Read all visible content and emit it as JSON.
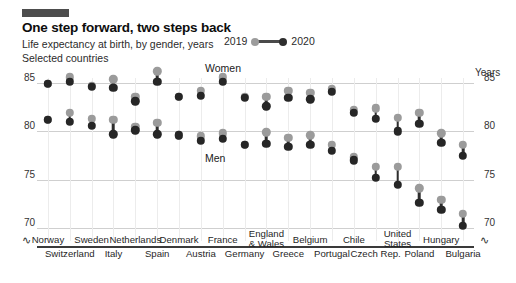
{
  "header": {
    "title": "One step forward, two steps back",
    "subtitle": "Life expectancy at birth, by gender, years",
    "subtitle2": "Selected countries",
    "accent_color": "#4d4d4d"
  },
  "legend": {
    "label_2019": "2019",
    "label_2020": "2020",
    "color_2019": "#9b9b9b",
    "color_2020": "#262626"
  },
  "axis": {
    "units_label": "Years",
    "yticks": [
      "85",
      "80",
      "75",
      "70"
    ],
    "squiggle": "∿"
  },
  "annotations": {
    "women": "Women",
    "men": "Men"
  },
  "chart_data": {
    "type": "scatter",
    "title": "One step forward, two steps back",
    "subtitle": "Life expectancy at birth, by gender, years — Selected countries",
    "xlabel": "",
    "ylabel": "Years",
    "ylim": [
      69,
      86.5
    ],
    "yticks": [
      70,
      75,
      80,
      85
    ],
    "grid": true,
    "legend_position": "top-right",
    "series_names": [
      "2019",
      "2020"
    ],
    "groups": [
      "Women",
      "Men"
    ],
    "categories": [
      "Norway",
      "Switzerland",
      "Sweden",
      "Italy",
      "Netherlands",
      "Spain",
      "Denmark",
      "Austria",
      "France",
      "Germany",
      "England & Wales",
      "Greece",
      "Belgium",
      "Portugal",
      "Chile",
      "Czech Rep.",
      "United States",
      "Poland",
      "Hungary",
      "Bulgaria"
    ],
    "category_rows": [
      "top",
      "bottom",
      "top",
      "bottom",
      "top",
      "bottom",
      "top",
      "bottom",
      "top",
      "bottom",
      "top",
      "bottom",
      "top",
      "bottom",
      "top",
      "bottom",
      "top",
      "bottom",
      "top",
      "bottom"
    ],
    "women": {
      "2019": [
        84.9,
        85.6,
        84.7,
        85.4,
        83.6,
        86.2,
        83.6,
        84.2,
        85.6,
        83.6,
        83.6,
        84.2,
        84.0,
        84.4,
        82.2,
        82.4,
        81.4,
        81.9,
        79.8,
        78.6
      ],
      "2020": [
        84.9,
        85.1,
        84.6,
        84.5,
        83.1,
        85.1,
        83.6,
        83.7,
        85.1,
        83.5,
        82.6,
        83.5,
        83.3,
        84.1,
        81.9,
        81.3,
        80.0,
        80.8,
        78.8,
        77.5
      ]
    },
    "men": {
      "2019": [
        81.2,
        81.9,
        81.3,
        81.2,
        80.5,
        80.9,
        79.6,
        79.5,
        79.8,
        78.6,
        79.9,
        79.3,
        79.6,
        78.6,
        77.3,
        76.3,
        76.3,
        74.1,
        72.9,
        71.5
      ],
      "2020": [
        81.2,
        81.0,
        80.6,
        79.7,
        80.1,
        79.7,
        79.6,
        79.0,
        79.2,
        78.6,
        78.7,
        78.4,
        78.6,
        78.0,
        77.0,
        75.2,
        74.5,
        72.6,
        71.9,
        70.2
      ]
    }
  }
}
